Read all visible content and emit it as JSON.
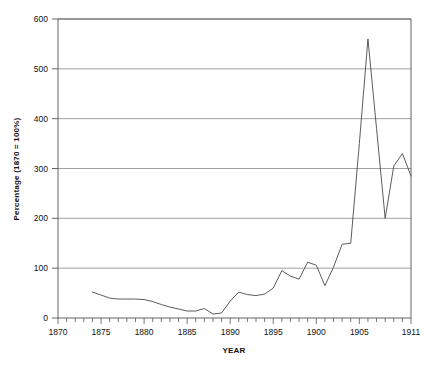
{
  "chart_data": {
    "type": "line",
    "title": "",
    "xlabel": "YEAR",
    "ylabel": "Percentage (1870 = 100%)",
    "xlim": [
      1870,
      1911
    ],
    "ylim": [
      0,
      600
    ],
    "grid": true,
    "grid_axis": "y",
    "legend": "none",
    "line_color": "#4a4a4a",
    "axis_color": "#555555",
    "grid_color": "#888888",
    "background_color": "#ffffff",
    "x_ticks_major": [
      1870,
      1875,
      1880,
      1885,
      1890,
      1895,
      1900,
      1905,
      1911
    ],
    "x_tick_labels": [
      "1870",
      "1875",
      "1880",
      "1885",
      "1890",
      "1895",
      "1900",
      "1905",
      "1911"
    ],
    "x_ticks_minor_step": 1,
    "y_ticks": [
      0,
      100,
      200,
      300,
      400,
      500,
      600
    ],
    "y_tick_labels": [
      "0",
      "100",
      "200",
      "300",
      "400",
      "500",
      "600"
    ],
    "x": [
      1874,
      1875,
      1876,
      1877,
      1878,
      1879,
      1880,
      1881,
      1882,
      1883,
      1884,
      1885,
      1886,
      1887,
      1888,
      1889,
      1890,
      1891,
      1892,
      1893,
      1894,
      1895,
      1896,
      1897,
      1898,
      1899,
      1900,
      1901,
      1902,
      1903,
      1904,
      1905,
      1906,
      1907,
      1908,
      1909,
      1910,
      1911
    ],
    "values": [
      52,
      46,
      40,
      38,
      38,
      38,
      37,
      33,
      27,
      22,
      18,
      14,
      14,
      19,
      8,
      10,
      34,
      52,
      47,
      45,
      48,
      60,
      95,
      84,
      78,
      112,
      106,
      65,
      102,
      148,
      150,
      350,
      560,
      380,
      200,
      305,
      330,
      285
    ],
    "series": [
      {
        "name": "Percentage (1870 = 100%)",
        "values": [
          52,
          46,
          40,
          38,
          38,
          38,
          37,
          33,
          27,
          22,
          18,
          14,
          14,
          19,
          8,
          10,
          34,
          52,
          47,
          45,
          48,
          60,
          95,
          84,
          78,
          112,
          106,
          65,
          102,
          148,
          150,
          350,
          560,
          380,
          200,
          305,
          330,
          285
        ]
      }
    ],
    "annotations": []
  }
}
